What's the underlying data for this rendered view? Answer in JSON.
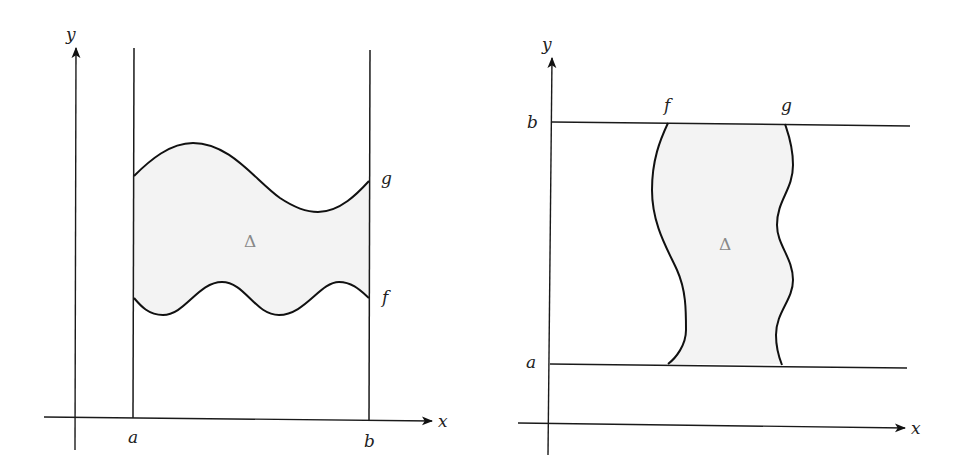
{
  "figures": [
    {
      "id": "left",
      "description": "Region between curves f (bottom) and g (top) over x in [a, b]",
      "axes": {
        "x_label": "x",
        "y_label": "y"
      },
      "bounds": {
        "lower_label": "a",
        "upper_label": "b",
        "orientation": "vertical lines"
      },
      "curves": {
        "top": "g",
        "bottom": "f"
      },
      "region_label": "Δ",
      "colors": {
        "region_fill": "#f3f3f3",
        "stroke": "#111111",
        "region_label": "#888888"
      }
    },
    {
      "id": "right",
      "description": "Region between curves f (left) and g (right) over y in [a, b]",
      "axes": {
        "x_label": "x",
        "y_label": "y"
      },
      "bounds": {
        "lower_label": "a",
        "upper_label": "b",
        "orientation": "horizontal lines"
      },
      "curves": {
        "left": "f",
        "right": "g"
      },
      "region_label": "Δ",
      "colors": {
        "region_fill": "#f3f3f3",
        "stroke": "#111111",
        "region_label": "#888888"
      }
    }
  ]
}
